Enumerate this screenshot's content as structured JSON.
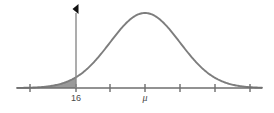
{
  "figure": {
    "title": "",
    "background_color": "#ffffff",
    "curve_color": "#7d7d7d",
    "shade_color": "#8c8c8c",
    "axis_color": "#6e6e6e",
    "marker_color": "#111111",
    "label_color": "#4a4a4a"
  },
  "chart_data": {
    "type": "line",
    "title": "",
    "xlabel": "",
    "ylabel": "",
    "subtitle": "",
    "grid": false,
    "legend": "none",
    "distribution": "normal",
    "mean_label": "μ",
    "mean_x_pixel": 145,
    "cutoff_label": "16",
    "cutoff_x_pixel": 76,
    "shaded_region": "left-tail",
    "shaded_region_description": "area under the normal curve to the left of x = 16",
    "axis_ticks": [
      {
        "x_pixel": 30,
        "label": ""
      },
      {
        "x_pixel": 76,
        "label": "16"
      },
      {
        "x_pixel": 110,
        "label": ""
      },
      {
        "x_pixel": 145,
        "label": "μ"
      },
      {
        "x_pixel": 180,
        "label": ""
      },
      {
        "x_pixel": 215,
        "label": ""
      },
      {
        "x_pixel": 250,
        "label": ""
      }
    ],
    "axis_range_pixels": [
      17,
      262
    ],
    "baseline_y_pixel": 88,
    "peak_y_pixel": 13,
    "sigma_pixels": 35,
    "marker": {
      "shape": "left-pointing-triangle",
      "x_pixel": 76,
      "y_pixel": 9
    },
    "x": [
      17,
      30,
      45,
      60,
      76,
      90,
      110,
      128,
      145,
      162,
      180,
      198,
      215,
      232,
      250,
      262
    ],
    "y": [
      88.0,
      87.7,
      86.5,
      83.6,
      77.5,
      68.0,
      49.0,
      25.0,
      13.0,
      20.0,
      38.0,
      58.0,
      73.0,
      82.0,
      86.5,
      87.6
    ]
  },
  "labels": {
    "cutoff": "16",
    "mean": "μ"
  }
}
